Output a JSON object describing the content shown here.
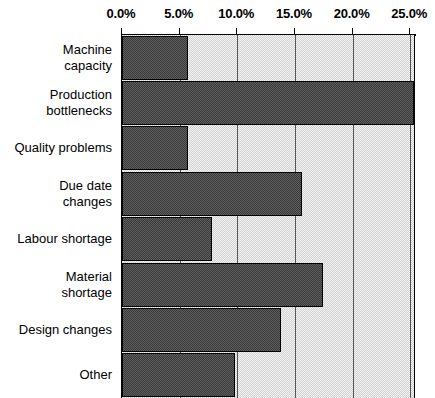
{
  "chart_data": {
    "type": "bar",
    "orientation": "horizontal",
    "title": "",
    "xlabel": "",
    "ylabel": "",
    "xlim": [
      0,
      25.5
    ],
    "xticks": [
      0.0,
      5.0,
      10.0,
      15.0,
      20.0,
      25.0
    ],
    "xtick_labels": [
      "0.0%",
      "5.0%",
      "10.0%",
      "15.0%",
      "20.0%",
      "25.0%"
    ],
    "axis_position": "top",
    "grid": true,
    "grid_axis": "x",
    "legend": "none",
    "categories": [
      "Machine\ncapacity",
      "Production\nbottlenecks",
      "Quality problems",
      "Due date\nchanges",
      "Labour shortage",
      "Material\nshortage",
      "Design changes",
      "Other"
    ],
    "values": [
      5.7,
      25.3,
      5.7,
      15.6,
      7.8,
      17.4,
      13.8,
      9.8
    ],
    "value_unit": "%",
    "colors": {
      "bar_fill": "#4c4c4c",
      "bar_border": "#000000",
      "plot_background": "#e3e3e3",
      "gridline": "#555555",
      "axis": "#000000",
      "text": "#000000"
    }
  }
}
